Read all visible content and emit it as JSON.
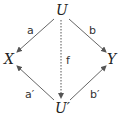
{
  "diagram": {
    "nodes": [
      {
        "id": "U",
        "label": "U",
        "x": 61,
        "y": 15
      },
      {
        "id": "X",
        "label": "X",
        "x": 10,
        "y": 63
      },
      {
        "id": "Y",
        "label": "Y",
        "x": 112,
        "y": 63
      },
      {
        "id": "U2",
        "label": "U′",
        "x": 62,
        "y": 112
      }
    ],
    "edges": [
      {
        "from": "U",
        "to": "X",
        "label": "a",
        "style": "solid"
      },
      {
        "from": "U",
        "to": "Y",
        "label": "b",
        "style": "solid"
      },
      {
        "from": "U2",
        "to": "X",
        "label": "a′",
        "style": "solid"
      },
      {
        "from": "U2",
        "to": "Y",
        "label": "b′",
        "style": "solid"
      },
      {
        "from": "U",
        "to": "U2",
        "label": "f",
        "style": "dotted"
      }
    ],
    "colors": {
      "stroke": "#555555",
      "text": "#222222"
    }
  }
}
